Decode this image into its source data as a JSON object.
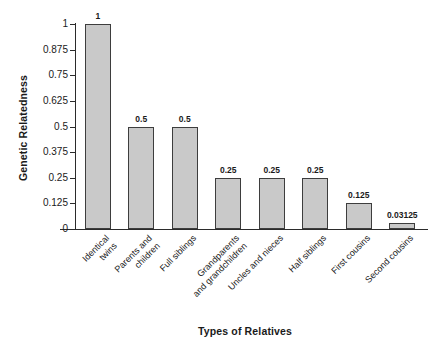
{
  "chart_data": {
    "type": "bar",
    "title": "",
    "xlabel": "Types of Relatives",
    "ylabel": "Genetic Relatedness",
    "ylim": [
      0,
      1
    ],
    "grid": false,
    "legend": false,
    "bar_color": "#c9c9c9",
    "bar_edge_color": "#3d3d3d",
    "axis_color": "#2b2b2b",
    "ytick_labels": [
      "0",
      "0.125",
      "0.25",
      "0.375",
      "0.5",
      "0.625",
      "0.75",
      "0.875",
      "1"
    ],
    "ytick_values": [
      0,
      0.125,
      0.25,
      0.375,
      0.5,
      0.625,
      0.75,
      0.875,
      1
    ],
    "categories": [
      "Identical\ntwins",
      "Parents and\nchildren",
      "Full siblings",
      "Grandparents\nand grandchildren",
      "Uncles and nieces",
      "Half siblings",
      "First cousins",
      "Second cousins"
    ],
    "values": [
      1,
      0.5,
      0.5,
      0.25,
      0.25,
      0.25,
      0.125,
      0.03125
    ],
    "value_labels": [
      "1",
      "0.5",
      "0.5",
      "0.25",
      "0.25",
      "0.25",
      "0.125",
      "0.03125"
    ]
  },
  "axes": {
    "y_title": "Genetic Relatedness",
    "x_title": "Types of Relatives"
  }
}
